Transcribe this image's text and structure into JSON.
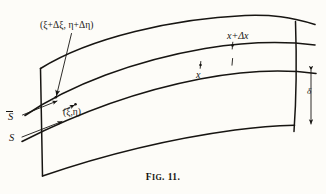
{
  "figure": {
    "caption_prefix": "F",
    "caption_small": "IG",
    "caption_number": ". 11.",
    "caption_full": "FIG. 11.",
    "background_color": "#fdfcf8",
    "ink_color": "#171512"
  },
  "labels": {
    "point_upper_surface": "(ξ+Δξ, η+Δη)",
    "point_lower_surface": "(ξ,η)",
    "coordinate_x": "x",
    "coordinate_x_plus_dx": "x+Δx",
    "surface_s_bar": "S",
    "surface_s": "S",
    "thickness": "δ"
  },
  "icons": {
    "arrow_leader": "arrow-leader-icon",
    "dimension_arrow": "double-headed-arrow-icon",
    "tick_mark": "tick-mark-icon"
  },
  "geometry": {
    "type": "curved-shell-element",
    "curve_count": 4,
    "left_edge": "slanted-line",
    "right_edge": "curved-line",
    "description": "Curved shell segment bounded by surfaces S and S-bar with thickness delta"
  }
}
